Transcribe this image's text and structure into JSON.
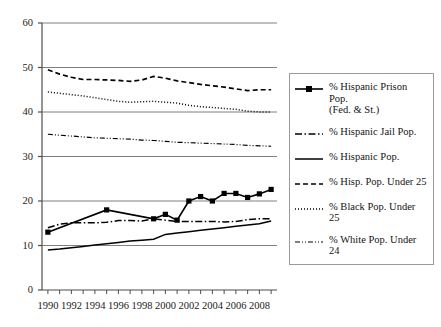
{
  "chart_data": {
    "type": "line",
    "title": "",
    "xlabel": "",
    "ylabel": "",
    "xlim": [
      1989.5,
      2009.5
    ],
    "ylim": [
      0,
      60
    ],
    "yticks": [
      0,
      10,
      20,
      30,
      40,
      50,
      60
    ],
    "ytick_labels": [
      "0",
      "10",
      "20",
      "30",
      "40",
      "50",
      "60"
    ],
    "xticks": [
      1990,
      1991,
      1992,
      1993,
      1994,
      1995,
      1996,
      1997,
      1998,
      1999,
      2000,
      2001,
      2002,
      2003,
      2004,
      2005,
      2006,
      2007,
      2008,
      2009
    ],
    "xtick_labels": [
      "1990",
      "1992",
      "1994",
      "1996",
      "1998",
      "2000",
      "2002",
      "2004",
      "2006",
      "2008"
    ],
    "xtick_label_years": [
      1990,
      1992,
      1994,
      1996,
      1998,
      2000,
      2002,
      2004,
      2006,
      2008
    ],
    "grid": "horizontal",
    "legend_position": "right-outside",
    "series": [
      {
        "name": "% Hispanic Prison Pop. (Fed. & St.)",
        "style": "solid-with-square-markers",
        "markers": true,
        "x": [
          1990,
          1995,
          1999,
          2000,
          2001,
          2002,
          2003,
          2004,
          2005,
          2006,
          2007,
          2008,
          2009
        ],
        "values": [
          13.0,
          18.0,
          16.0,
          17.0,
          15.7,
          20.0,
          21.0,
          20.0,
          21.7,
          21.7,
          20.8,
          21.6,
          22.6
        ]
      },
      {
        "name": "% Hispanic Jail Pop.",
        "style": "dash-dot",
        "markers": false,
        "x": [
          1990,
          1991,
          1992,
          1993,
          1994,
          1995,
          1996,
          1997,
          1998,
          1999,
          2000,
          2001,
          2002,
          2003,
          2004,
          2005,
          2006,
          2007,
          2008,
          2009
        ],
        "values": [
          14.0,
          14.8,
          15.1,
          15.1,
          15.1,
          15.2,
          15.6,
          15.6,
          15.5,
          16.0,
          15.7,
          15.4,
          15.4,
          15.4,
          15.4,
          15.3,
          15.4,
          15.8,
          16.0,
          16.0
        ]
      },
      {
        "name": "% Hispanic Pop.",
        "style": "solid",
        "markers": false,
        "x": [
          1990,
          1991,
          1992,
          1993,
          1994,
          1995,
          1996,
          1997,
          1998,
          1999,
          2000,
          2001,
          2002,
          2003,
          2004,
          2005,
          2006,
          2007,
          2008,
          2009
        ],
        "values": [
          9.0,
          9.2,
          9.5,
          9.8,
          10.1,
          10.4,
          10.7,
          11.0,
          11.2,
          11.4,
          12.5,
          12.8,
          13.1,
          13.4,
          13.7,
          14.0,
          14.3,
          14.6,
          14.9,
          15.5
        ]
      },
      {
        "name": "% Hisp. Pop. Under 25",
        "style": "dashed",
        "markers": false,
        "x": [
          1990,
          1991,
          1992,
          1993,
          1994,
          1995,
          1996,
          1997,
          1998,
          1999,
          2000,
          2001,
          2002,
          2003,
          2004,
          2005,
          2006,
          2007,
          2008,
          2009
        ],
        "values": [
          49.5,
          48.5,
          47.8,
          47.3,
          47.3,
          47.2,
          47.1,
          46.9,
          47.2,
          48.0,
          47.6,
          47.0,
          46.6,
          46.2,
          45.9,
          45.6,
          45.2,
          44.8,
          45.0,
          45.0
        ]
      },
      {
        "name": "% Black Pop. Under 25",
        "style": "dotted",
        "markers": false,
        "x": [
          1990,
          1991,
          1992,
          1993,
          1994,
          1995,
          1996,
          1997,
          1998,
          1999,
          2000,
          2001,
          2002,
          2003,
          2004,
          2005,
          2006,
          2007,
          2008,
          2009
        ],
        "values": [
          44.5,
          44.2,
          43.9,
          43.6,
          43.2,
          42.8,
          42.4,
          42.2,
          42.3,
          42.4,
          42.2,
          42.0,
          41.5,
          41.2,
          41.0,
          40.8,
          40.6,
          40.2,
          40.0,
          40.0
        ]
      },
      {
        "name": "% White Pop. Under 24",
        "style": "dash-dot-dot",
        "markers": false,
        "x": [
          1990,
          1991,
          1992,
          1993,
          1994,
          1995,
          1996,
          1997,
          1998,
          1999,
          2000,
          2001,
          2002,
          2003,
          2004,
          2005,
          2006,
          2007,
          2008,
          2009
        ],
        "values": [
          35.0,
          34.8,
          34.6,
          34.4,
          34.2,
          34.1,
          34.0,
          33.9,
          33.7,
          33.6,
          33.4,
          33.2,
          33.1,
          33.0,
          32.9,
          32.8,
          32.7,
          32.5,
          32.4,
          32.3
        ]
      }
    ],
    "colors": {
      "line": "#000000",
      "grid": "#808080",
      "axis": "#4d4d4d",
      "legend_border": "#9a9a9a"
    }
  },
  "legend": {
    "items": [
      {
        "label": "% Hispanic Prison Pop.\n(Fed. & St.)",
        "style": "solid-with-square-markers"
      },
      {
        "label": "% Hispanic Jail Pop.",
        "style": "dash-dot"
      },
      {
        "label": "% Hispanic Pop.",
        "style": "solid"
      },
      {
        "label": "% Hisp. Pop. Under 25",
        "style": "dashed"
      },
      {
        "label": "% Black Pop. Under 25",
        "style": "dotted"
      },
      {
        "label": "% White Pop. Under 24",
        "style": "dash-dot-dot"
      }
    ]
  }
}
